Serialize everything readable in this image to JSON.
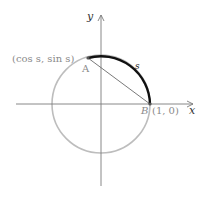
{
  "diagram": {
    "axes": {
      "x_label": "x",
      "y_label": "y"
    },
    "points": {
      "A": {
        "name": "A",
        "coord_label": "(cos s, sin s)"
      },
      "B": {
        "name": "B",
        "coord_label": "(1, 0)"
      }
    },
    "arc_label": "s",
    "colors": {
      "circle": "#bdbdbd",
      "arc": "#111111",
      "axes": "#7a7a7a",
      "chord": "#6a6a6a",
      "labels": "#8a8a8a"
    }
  }
}
